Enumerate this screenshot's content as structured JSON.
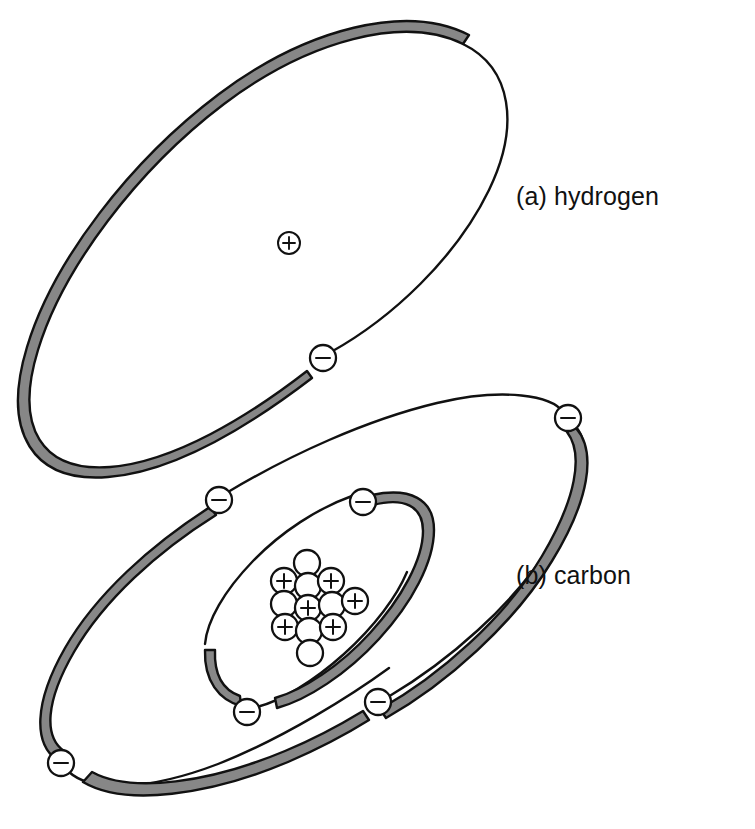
{
  "figure": {
    "background_color": "#ffffff",
    "ink_color": "#111111",
    "ribbon_fill_color": "#878787",
    "particle_fill_color": "#ffffff"
  },
  "captions": {
    "hydrogen": "(a) hydrogen",
    "carbon": "(b) carbon"
  },
  "symbols": {
    "proton": "+",
    "neutron": "",
    "electron": "−"
  },
  "atoms": [
    {
      "id": "hydrogen",
      "label": "(a) hydrogen",
      "caption_position": {
        "x": 516,
        "y": 205
      },
      "nucleus": {
        "name": "hydrogen-nucleus",
        "center": {
          "x": 289,
          "y": 243
        },
        "particles": [
          {
            "kind": "proton",
            "sign": "+",
            "cx": 289,
            "cy": 243,
            "r": 11
          }
        ],
        "proton_count": 1,
        "neutron_count": 0
      },
      "shells": [
        {
          "name": "hydrogen-shell-1",
          "shell_index": 1,
          "electron_count": 1,
          "electrons": [
            {
              "sign": "−",
              "cx": 323,
              "cy": 358,
              "r": 13
            }
          ]
        }
      ]
    },
    {
      "id": "carbon",
      "label": "(b) carbon",
      "caption_position": {
        "x": 516,
        "y": 584
      },
      "nucleus": {
        "name": "carbon-nucleus",
        "center": {
          "x": 311,
          "y": 600
        },
        "proton_count": 6,
        "neutron_count": 6,
        "mass_number": 12,
        "particles": [
          {
            "kind": "neutron",
            "sign": "",
            "cx": 307,
            "cy": 563,
            "r": 13
          },
          {
            "kind": "proton",
            "sign": "+",
            "cx": 284,
            "cy": 581,
            "r": 13
          },
          {
            "kind": "neutron",
            "sign": "",
            "cx": 308,
            "cy": 586,
            "r": 13
          },
          {
            "kind": "proton",
            "sign": "+",
            "cx": 331,
            "cy": 581,
            "r": 13
          },
          {
            "kind": "neutron",
            "sign": "",
            "cx": 284,
            "cy": 604,
            "r": 13
          },
          {
            "kind": "proton",
            "sign": "+",
            "cx": 308,
            "cy": 608,
            "r": 13
          },
          {
            "kind": "neutron",
            "sign": "",
            "cx": 332,
            "cy": 605,
            "r": 13
          },
          {
            "kind": "proton",
            "sign": "+",
            "cx": 355,
            "cy": 601,
            "r": 13
          },
          {
            "kind": "proton",
            "sign": "+",
            "cx": 285,
            "cy": 627,
            "r": 13
          },
          {
            "kind": "neutron",
            "sign": "",
            "cx": 309,
            "cy": 631,
            "r": 13
          },
          {
            "kind": "proton",
            "sign": "+",
            "cx": 333,
            "cy": 627,
            "r": 13
          },
          {
            "kind": "neutron",
            "sign": "",
            "cx": 310,
            "cy": 653,
            "r": 13
          }
        ]
      },
      "shells": [
        {
          "name": "carbon-shell-1",
          "shell_index": 1,
          "electron_count": 2,
          "electrons": [
            {
              "sign": "−",
              "cx": 363,
              "cy": 502,
              "r": 13
            },
            {
              "sign": "−",
              "cx": 247,
              "cy": 712,
              "r": 13
            }
          ]
        },
        {
          "name": "carbon-shell-2",
          "shell_index": 2,
          "electron_count": 4,
          "electrons": [
            {
              "sign": "−",
              "cx": 568,
              "cy": 418,
              "r": 13
            },
            {
              "sign": "−",
              "cx": 219,
              "cy": 500,
              "r": 13
            },
            {
              "sign": "−",
              "cx": 378,
              "cy": 702,
              "r": 13
            },
            {
              "sign": "−",
              "cx": 61,
              "cy": 763,
              "r": 13
            }
          ]
        }
      ]
    }
  ]
}
